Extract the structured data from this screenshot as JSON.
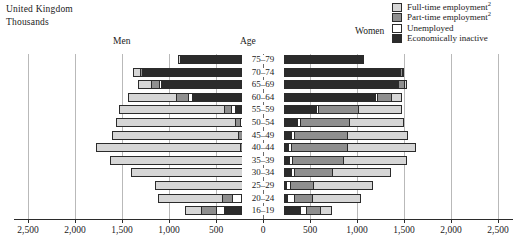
{
  "country": "United Kingdom",
  "units": "Thousands",
  "headers": {
    "men": "Men",
    "age": "Age",
    "women": "Women"
  },
  "legend": {
    "items": [
      {
        "label": "Full-time employment",
        "note": "2",
        "color": "#d6d6d6",
        "key": "full_time"
      },
      {
        "label": "Part-time employment",
        "note": "2",
        "color": "#8f8f8f",
        "key": "part_time"
      },
      {
        "label": "Unemployed",
        "note": "",
        "color": "#ffffff",
        "key": "unemployed"
      },
      {
        "label": "Economically inactive",
        "note": "",
        "color": "#2b2b2b",
        "key": "inactive"
      }
    ]
  },
  "chart_data": {
    "type": "bar",
    "subtype": "population-pyramid-stacked",
    "title": "United Kingdom",
    "ylabel": "Age",
    "xlabel": "Thousands",
    "xlim": [
      -2500,
      2500
    ],
    "xticks": [
      2500,
      2000,
      1500,
      1000,
      500,
      0,
      500,
      1000,
      1500,
      2000,
      2500
    ],
    "xticklabels": [
      "2,500",
      "2,000",
      "1,500",
      "1,000",
      "500",
      "0",
      "500",
      "1,000",
      "1,500",
      "2,000",
      "2,500"
    ],
    "grid": true,
    "legend_position": "top-right",
    "categories": [
      "75–79",
      "70–74",
      "65–69",
      "60–64",
      "55–59",
      "50–54",
      "45–49",
      "40–44",
      "35–39",
      "30–34",
      "25–29",
      "20–24",
      "16–19"
    ],
    "stack_order_from_axis": [
      "inactive",
      "unemployed",
      "part_time",
      "full_time"
    ],
    "series": [
      {
        "name": "Men",
        "side": "left",
        "segments": {
          "inactive": [
            880,
            1280,
            1090,
            760,
            300,
            200,
            175,
            150,
            120,
            110,
            95,
            230,
            415
          ],
          "unemployed": [
            0,
            10,
            20,
            40,
            45,
            45,
            45,
            50,
            45,
            55,
            60,
            95,
            85
          ],
          "part_time": [
            0,
            20,
            85,
            125,
            75,
            55,
            50,
            50,
            50,
            55,
            60,
            115,
            160
          ],
          "full_time": [
            20,
            70,
            130,
            510,
            1110,
            1265,
            1340,
            1525,
            1410,
            1185,
            935,
            675,
            175
          ]
        },
        "totals": [
          900,
          1380,
          1325,
          1435,
          1530,
          1565,
          1610,
          1775,
          1625,
          1405,
          1150,
          1115,
          835
        ]
      },
      {
        "name": "Women",
        "side": "right",
        "segments": {
          "inactive": [
            1045,
            1450,
            1430,
            1190,
            560,
            365,
            300,
            265,
            275,
            300,
            245,
            260,
            390
          ],
          "unemployed": [
            0,
            5,
            10,
            25,
            25,
            25,
            30,
            30,
            30,
            35,
            40,
            70,
            65
          ],
          "part_time": [
            5,
            20,
            55,
            145,
            430,
            525,
            560,
            600,
            545,
            395,
            250,
            190,
            150
          ],
          "full_time": [
            5,
            15,
            35,
            115,
            465,
            590,
            650,
            735,
            685,
            630,
            640,
            520,
            130
          ]
        },
        "totals": [
          1055,
          1490,
          1530,
          1475,
          1480,
          1505,
          1540,
          1630,
          1535,
          1360,
          1175,
          1040,
          735
        ]
      }
    ]
  }
}
